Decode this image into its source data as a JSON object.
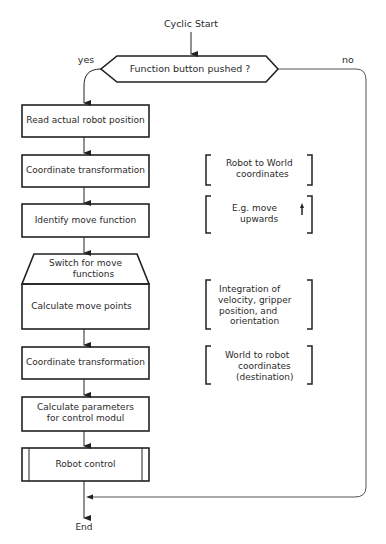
{
  "diagram": {
    "start_label": "Cyclic Start",
    "decision": {
      "label": "Function button pushed ?",
      "yes_label": "yes",
      "no_label": "no"
    },
    "steps": [
      {
        "id": "read-position",
        "label": "Read  actual  robot position"
      },
      {
        "id": "coord-transform-1",
        "label": "Coordinate  transformation"
      },
      {
        "id": "identify-move",
        "label": "Identify  move  function"
      },
      {
        "id": "switch-move",
        "label_line1": "Switch  for  move",
        "label_line2": "functions"
      },
      {
        "id": "calc-move-points",
        "label": "Calculate  move  points"
      },
      {
        "id": "coord-transform-2",
        "label": "Coordinate  transformation"
      },
      {
        "id": "calc-params",
        "label_line1": "Calculate  parameters",
        "label_line2": "for  control  modul"
      },
      {
        "id": "robot-control",
        "label": "Robot  control"
      }
    ],
    "annotations": [
      {
        "id": "robot-to-world",
        "line1": "Robot  to  World",
        "line2": "coordinates"
      },
      {
        "id": "move-upwards",
        "line1": "E.g.  move",
        "line2": "upwards"
      },
      {
        "id": "integration",
        "line1": "Integration  of",
        "line2": "velocity,  gripper",
        "line3": "position,  and",
        "line4": "orientation"
      },
      {
        "id": "world-to-robot",
        "line1": "World  to  robot",
        "line2": "coordinates",
        "line3": "(destination)"
      }
    ],
    "end_label": "End"
  }
}
